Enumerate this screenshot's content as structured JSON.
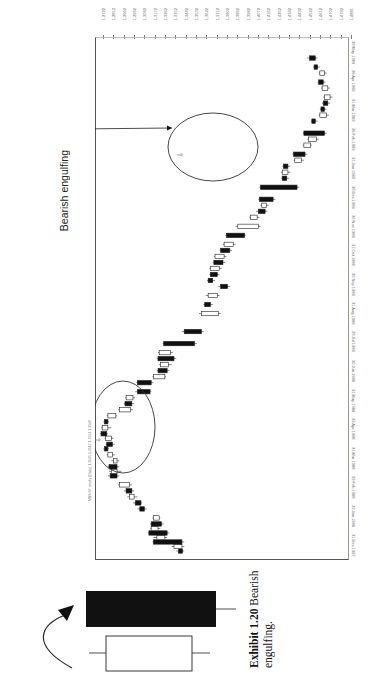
{
  "chart_data": {
    "type": "candlestick",
    "orientation": "rotated-90-clockwise",
    "title": "",
    "header_text": "MBS ST cmdty (Daily) 1.3545 1.3517 1.3553 1.3540",
    "xlabel": "Date",
    "ylabel": "Price",
    "date_ticks": [
      "31 Dec 1987",
      "29 Jan 1988",
      "29 Feb 1988",
      "31 Mar 1988",
      "29 Apr 1988",
      "31 May 1988",
      "30 Jun 1988",
      "29 Jul 1988",
      "31 Aug 1988",
      "30 Sep 1988",
      "31 Oct 1988",
      "30 Nov 1988",
      "30 Dec 1988",
      "31 Jan 1989",
      "28 Feb 1989",
      "31 Mar 1989",
      "28 Apr 1989",
      "30 May 1989"
    ],
    "price_ticks": [
      "1.4881",
      "1.4792",
      "1.4702",
      "1.4612",
      "1.4522",
      "1.4432",
      "1.4342",
      "1.4252",
      "1.4162",
      "1.4072",
      "1.3982",
      "1.3892",
      "1.3802",
      "1.3712",
      "1.3622",
      "1.3532",
      "1.3442",
      "1.3352",
      "1.3262",
      "1.3172",
      "1.3082",
      "1.2992",
      "1.2902",
      "1.2812",
      "1.2722"
    ],
    "ylim": [
      1.2722,
      1.4881
    ],
    "grid": false,
    "candles": [
      {
        "t": 2,
        "o": 1.3455,
        "c": 1.342,
        "h": 1.347,
        "l": 1.34
      },
      {
        "t": 5,
        "o": 1.338,
        "c": 1.345,
        "h": 1.347,
        "l": 1.336
      },
      {
        "t": 8,
        "o": 1.345,
        "c": 1.32,
        "h": 1.347,
        "l": 1.319
      },
      {
        "t": 11,
        "o": 1.323,
        "c": 1.33,
        "h": 1.332,
        "l": 1.32
      },
      {
        "t": 14,
        "o": 1.332,
        "c": 1.316,
        "h": 1.334,
        "l": 1.315
      },
      {
        "t": 17,
        "o": 1.318,
        "c": 1.324,
        "h": 1.326,
        "l": 1.317
      },
      {
        "t": 20,
        "o": 1.327,
        "c": 1.318,
        "h": 1.329,
        "l": 1.317
      },
      {
        "t": 24,
        "o": 1.32,
        "c": 1.325,
        "h": 1.326,
        "l": 1.319
      },
      {
        "t": 30,
        "o": 1.312,
        "c": 1.308,
        "h": 1.314,
        "l": 1.306
      },
      {
        "t": 34,
        "o": 1.309,
        "c": 1.304,
        "h": 1.31,
        "l": 1.302
      },
      {
        "t": 38,
        "o": 1.299,
        "c": 1.303,
        "h": 1.306,
        "l": 1.297
      },
      {
        "t": 42,
        "o": 1.301,
        "c": 1.296,
        "h": 1.303,
        "l": 1.294
      },
      {
        "t": 46,
        "o": 1.29,
        "c": 1.299,
        "h": 1.301,
        "l": 1.289
      },
      {
        "t": 52,
        "o": 1.288,
        "c": 1.282,
        "h": 1.29,
        "l": 1.28
      },
      {
        "t": 55,
        "o": 1.283,
        "c": 1.288,
        "h": 1.292,
        "l": 1.281
      },
      {
        "t": 58,
        "o": 1.288,
        "c": 1.281,
        "h": 1.29,
        "l": 1.28
      },
      {
        "t": 62,
        "o": 1.285,
        "c": 1.288,
        "h": 1.29,
        "l": 1.283
      },
      {
        "t": 66,
        "o": 1.28,
        "c": 1.284,
        "h": 1.286,
        "l": 1.279
      },
      {
        "t": 70,
        "o": 1.28,
        "c": 1.277,
        "h": 1.281,
        "l": 1.276
      },
      {
        "t": 73,
        "o": 1.284,
        "c": 1.279,
        "h": 1.286,
        "l": 1.278
      },
      {
        "t": 77,
        "o": 1.278,
        "c": 1.283,
        "h": 1.285,
        "l": 1.277
      },
      {
        "t": 80,
        "o": 1.279,
        "c": 1.274,
        "h": 1.28,
        "l": 1.273
      },
      {
        "t": 84,
        "o": 1.275,
        "c": 1.28,
        "h": 1.283,
        "l": 1.274
      },
      {
        "t": 88,
        "o": 1.28,
        "c": 1.277,
        "h": 1.281,
        "l": 1.276
      },
      {
        "t": 92,
        "o": 1.28,
        "c": 1.287,
        "h": 1.288,
        "l": 1.279
      },
      {
        "t": 96,
        "o": 1.29,
        "c": 1.3,
        "h": 1.302,
        "l": 1.289
      },
      {
        "t": 100,
        "o": 1.301,
        "c": 1.295,
        "h": 1.303,
        "l": 1.294
      },
      {
        "t": 104,
        "o": 1.296,
        "c": 1.302,
        "h": 1.304,
        "l": 1.295
      },
      {
        "t": 108,
        "o": 1.317,
        "c": 1.306,
        "h": 1.318,
        "l": 1.304
      },
      {
        "t": 114,
        "o": 1.318,
        "c": 1.306,
        "h": 1.32,
        "l": 1.305
      },
      {
        "t": 118,
        "o": 1.32,
        "c": 1.33,
        "h": 1.331,
        "l": 1.319
      },
      {
        "t": 122,
        "o": 1.332,
        "c": 1.324,
        "h": 1.334,
        "l": 1.323
      },
      {
        "t": 126,
        "o": 1.326,
        "c": 1.333,
        "h": 1.336,
        "l": 1.325
      },
      {
        "t": 130,
        "o": 1.338,
        "c": 1.324,
        "h": 1.34,
        "l": 1.323
      },
      {
        "t": 134,
        "o": 1.325,
        "c": 1.335,
        "h": 1.337,
        "l": 1.324
      },
      {
        "t": 140,
        "o": 1.356,
        "c": 1.329,
        "h": 1.358,
        "l": 1.328
      },
      {
        "t": 148,
        "o": 1.362,
        "c": 1.347,
        "h": 1.364,
        "l": 1.345
      },
      {
        "t": 160,
        "o": 1.362,
        "c": 1.377,
        "h": 1.379,
        "l": 1.36
      },
      {
        "t": 166,
        "o": 1.37,
        "c": 1.365,
        "h": 1.372,
        "l": 1.364
      },
      {
        "t": 172,
        "o": 1.368,
        "c": 1.376,
        "h": 1.378,
        "l": 1.366
      },
      {
        "t": 178,
        "o": 1.385,
        "c": 1.379,
        "h": 1.387,
        "l": 1.377
      },
      {
        "t": 182,
        "o": 1.372,
        "c": 1.368,
        "h": 1.374,
        "l": 1.367
      },
      {
        "t": 186,
        "o": 1.376,
        "c": 1.37,
        "h": 1.378,
        "l": 1.369
      },
      {
        "t": 190,
        "o": 1.37,
        "c": 1.378,
        "h": 1.38,
        "l": 1.369
      },
      {
        "t": 194,
        "o": 1.381,
        "c": 1.373,
        "h": 1.383,
        "l": 1.372
      },
      {
        "t": 198,
        "o": 1.374,
        "c": 1.382,
        "h": 1.384,
        "l": 1.373
      },
      {
        "t": 202,
        "o": 1.387,
        "c": 1.379,
        "h": 1.389,
        "l": 1.378
      },
      {
        "t": 206,
        "o": 1.382,
        "c": 1.39,
        "h": 1.392,
        "l": 1.381
      },
      {
        "t": 212,
        "o": 1.4,
        "c": 1.384,
        "h": 1.401,
        "l": 1.383
      },
      {
        "t": 218,
        "o": 1.394,
        "c": 1.412,
        "h": 1.414,
        "l": 1.392
      },
      {
        "t": 224,
        "o": 1.405,
        "c": 1.411,
        "h": 1.413,
        "l": 1.404
      },
      {
        "t": 228,
        "o": 1.418,
        "c": 1.412,
        "h": 1.42,
        "l": 1.41
      },
      {
        "t": 232,
        "o": 1.415,
        "c": 1.419,
        "h": 1.421,
        "l": 1.414
      },
      {
        "t": 236,
        "o": 1.425,
        "c": 1.413,
        "h": 1.427,
        "l": 1.412
      },
      {
        "t": 244,
        "o": 1.446,
        "c": 1.414,
        "h": 1.448,
        "l": 1.413
      },
      {
        "t": 250,
        "o": 1.437,
        "c": 1.433,
        "h": 1.439,
        "l": 1.432
      },
      {
        "t": 254,
        "o": 1.433,
        "c": 1.438,
        "h": 1.44,
        "l": 1.432
      },
      {
        "t": 258,
        "o": 1.438,
        "c": 1.434,
        "h": 1.44,
        "l": 1.433
      },
      {
        "t": 262,
        "o": 1.444,
        "c": 1.45,
        "h": 1.452,
        "l": 1.443
      },
      {
        "t": 266,
        "o": 1.453,
        "c": 1.443,
        "h": 1.455,
        "l": 1.442
      },
      {
        "t": 272,
        "o": 1.452,
        "c": 1.458,
        "h": 1.459,
        "l": 1.451
      },
      {
        "t": 276,
        "o": 1.456,
        "c": 1.463,
        "h": 1.465,
        "l": 1.455
      },
      {
        "t": 280,
        "o": 1.47,
        "c": 1.452,
        "h": 1.472,
        "l": 1.451
      },
      {
        "t": 288,
        "o": 1.462,
        "c": 1.459,
        "h": 1.464,
        "l": 1.458
      },
      {
        "t": 292,
        "o": 1.466,
        "c": 1.472,
        "h": 1.474,
        "l": 1.465
      },
      {
        "t": 296,
        "o": 1.47,
        "c": 1.467,
        "h": 1.472,
        "l": 1.466
      },
      {
        "t": 300,
        "o": 1.473,
        "c": 1.469,
        "h": 1.475,
        "l": 1.468
      },
      {
        "t": 304,
        "o": 1.47,
        "c": 1.475,
        "h": 1.477,
        "l": 1.469
      },
      {
        "t": 310,
        "o": 1.468,
        "c": 1.473,
        "h": 1.475,
        "l": 1.467
      },
      {
        "t": 314,
        "o": 1.469,
        "c": 1.465,
        "h": 1.471,
        "l": 1.464
      },
      {
        "t": 320,
        "o": 1.466,
        "c": 1.47,
        "h": 1.472,
        "l": 1.465
      },
      {
        "t": 324,
        "o": 1.464,
        "c": 1.461,
        "h": 1.466,
        "l": 1.46
      },
      {
        "t": 330,
        "o": 1.462,
        "c": 1.457,
        "h": 1.464,
        "l": 1.455
      }
    ],
    "annotations": [
      {
        "type": "ellipse",
        "label": "Bearish engulfing",
        "region": "first top (mid-1988)"
      },
      {
        "type": "ellipse",
        "label": "Bearish engulfing",
        "region": "second top (early 1989)"
      },
      {
        "type": "arrow",
        "from": "label",
        "to": "first ellipse"
      },
      {
        "type": "arrow",
        "from": "label",
        "to": "second ellipse"
      }
    ]
  },
  "chart": {
    "header_text": "MBS ST cmdty (Daily) 1.3545 1.3517 1.3553 1.3540",
    "annotation_label": "Bearish engulfing"
  },
  "caption": {
    "number": "Exhibit 1.20",
    "text": "Bearish engulfing."
  }
}
